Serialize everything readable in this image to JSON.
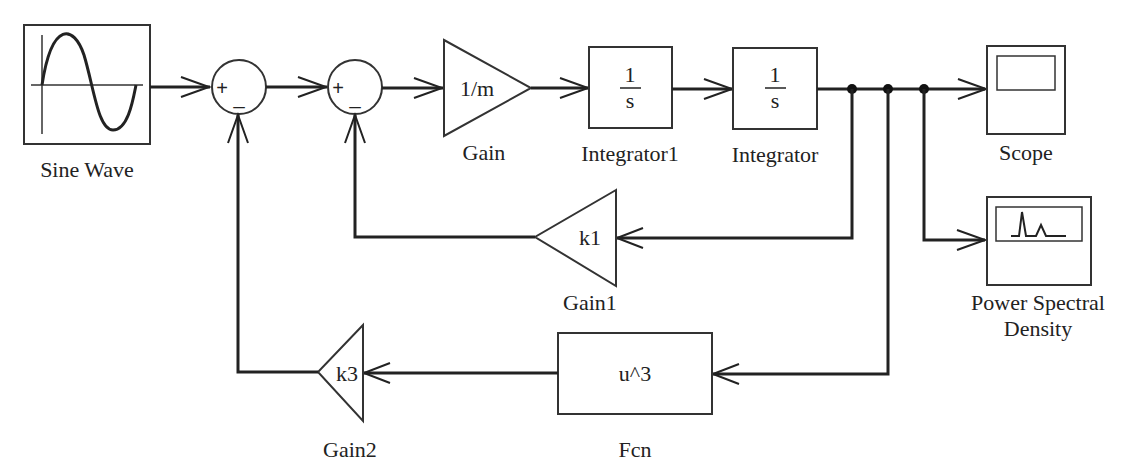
{
  "diagram": {
    "type": "Simulink block diagram",
    "blocks": {
      "sine_wave": {
        "label": "Sine Wave",
        "kind": "source"
      },
      "sum1": {
        "plus": "+",
        "minus": "_",
        "kind": "sum"
      },
      "sum2": {
        "plus": "+",
        "minus": "_",
        "kind": "sum"
      },
      "gain": {
        "label": "Gain",
        "value": "1/m",
        "kind": "gain"
      },
      "integrator1": {
        "label": "Integrator1",
        "num": "1",
        "den": "s",
        "kind": "integrator"
      },
      "integrator": {
        "label": "Integrator",
        "num": "1",
        "den": "s",
        "kind": "integrator"
      },
      "scope": {
        "label": "Scope",
        "kind": "sink"
      },
      "psd": {
        "label_line1": "Power Spectral",
        "label_line2": "Density",
        "kind": "sink"
      },
      "gain1": {
        "label": "Gain1",
        "value": "k1",
        "kind": "gain"
      },
      "gain2": {
        "label": "Gain2",
        "value": "k3",
        "kind": "gain"
      },
      "fcn": {
        "label": "Fcn",
        "value": "u^3",
        "kind": "function"
      }
    },
    "connections": [
      {
        "from": "Sine Wave",
        "to": "Sum1 (+)"
      },
      {
        "from": "Sum1",
        "to": "Sum2 (+)"
      },
      {
        "from": "Sum2",
        "to": "Gain"
      },
      {
        "from": "Gain",
        "to": "Integrator1"
      },
      {
        "from": "Integrator1",
        "to": "Integrator"
      },
      {
        "from": "Integrator",
        "to": "Scope"
      },
      {
        "from": "Integrator",
        "to": "Power Spectral Density"
      },
      {
        "from": "Integrator",
        "to": "Gain1"
      },
      {
        "from": "Integrator",
        "to": "Fcn"
      },
      {
        "from": "Gain1",
        "to": "Sum2 (-)"
      },
      {
        "from": "Fcn",
        "to": "Gain2"
      },
      {
        "from": "Gain2",
        "to": "Sum1 (-)"
      }
    ],
    "colors": {
      "stroke": "#222222",
      "background": "#ffffff"
    }
  }
}
